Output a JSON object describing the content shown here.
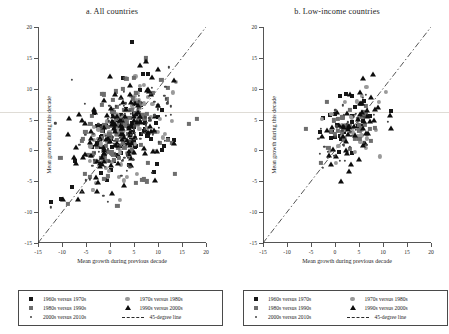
{
  "figure": {
    "panels": [
      {
        "id": "a",
        "title": "a. All countries",
        "xlabel": "Mean growth during previous decade",
        "ylabel": "Mean growth during this decade"
      },
      {
        "id": "b",
        "title": "b. Low-income countries",
        "xlabel": "Mean growth during previous decade",
        "ylabel": "Mean growth during this decade"
      }
    ],
    "legend": {
      "items": [
        {
          "label": "1960s versus 1970s",
          "marker": "square-dark",
          "color": "#171717"
        },
        {
          "label": "1970s versus 1980s",
          "marker": "circle-grey",
          "color": "#9a9a9a"
        },
        {
          "label": "1980s versus 1990s",
          "marker": "square-mid",
          "color": "#6e6e6e"
        },
        {
          "label": "1990s versus 2000s",
          "marker": "triangle-dark",
          "color": "#0d0d0d"
        },
        {
          "label": "2000s versus 2010s",
          "marker": "dot-small",
          "color": "#454545"
        },
        {
          "label": "45-degree line",
          "marker": "dash-dot-line",
          "color": "#2a2a2a"
        }
      ]
    },
    "chart_data": {
      "type": "scatter",
      "title": "Mean growth during this decade versus previous decade",
      "xlabel": "Mean growth during previous decade",
      "ylabel": "Mean growth during this decade",
      "xlim": [
        -15,
        20
      ],
      "ylim": [
        -15,
        20
      ],
      "xticks": [
        -15,
        -10,
        -5,
        0,
        5,
        10,
        15,
        20
      ],
      "yticks": [
        -15,
        -10,
        -5,
        0,
        5,
        10,
        15,
        20
      ],
      "grid": false,
      "legend_position": "below-axes",
      "reference_line": {
        "label": "45-degree line",
        "slope": 1,
        "intercept": 0,
        "style": "dash-dot",
        "color": "#2a2a2a"
      },
      "series": [
        {
          "name": "1960s versus 1970s",
          "marker": "square-dark",
          "color": "#171717"
        },
        {
          "name": "1970s versus 1980s",
          "marker": "circle-grey",
          "color": "#9a9a9a"
        },
        {
          "name": "1980s versus 1990s",
          "marker": "square-mid",
          "color": "#6e6e6e"
        },
        {
          "name": "1990s versus 2000s",
          "marker": "triangle-dark",
          "color": "#0d0d0d"
        },
        {
          "name": "2000s versus 2010s",
          "marker": "dot-small",
          "color": "#454545"
        }
      ],
      "panels": [
        {
          "id": "a",
          "name": "All countries",
          "n_points": 520,
          "cloud": {
            "center": [
              2.6,
              3.0
            ],
            "spread": [
              4.6,
              4.2
            ],
            "correlation": 0.33
          },
          "series_counts": [
            84,
            96,
            104,
            126,
            110
          ]
        },
        {
          "id": "b",
          "name": "Low-income countries",
          "n_points": 185,
          "cloud": {
            "center": [
              3.4,
              3.1
            ],
            "spread": [
              3.4,
              3.2
            ],
            "correlation": 0.46
          },
          "series_counts": [
            26,
            32,
            36,
            52,
            39
          ]
        }
      ]
    }
  }
}
